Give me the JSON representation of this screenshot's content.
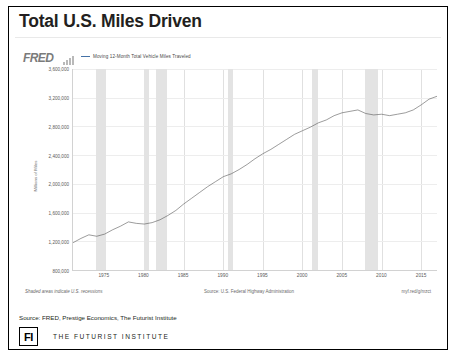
{
  "slide": {
    "title": "Total U.S. Miles Driven",
    "source_line": "Source: FRED, Prestige Economics, The Futurist Institute"
  },
  "footer": {
    "logo_text": "FI",
    "org_name": "THE FUTURIST INSTITUTE"
  },
  "fred": {
    "brand": "FRED",
    "spark_icon": "sparkline-icon",
    "legend": "Moving 12-Month Total Vehicle Miles Traveled",
    "note_left": "Shaded areas indicate U.S. recessions",
    "note_center": "Source: U.S. Federal Highway Administration",
    "note_right": "myf.red/g/mzct"
  },
  "chart_data": {
    "type": "line",
    "title": "Total U.S. Miles Driven",
    "legend_position": "top",
    "grid": true,
    "xlabel": "",
    "ylabel": "Millions of Miles",
    "ylim": [
      800000,
      3600000
    ],
    "yticks": [
      800000,
      1200000,
      1600000,
      2000000,
      2400000,
      2800000,
      3200000,
      3600000
    ],
    "ytick_labels": [
      "800,000",
      "1,200,000",
      "1,600,000",
      "2,000,000",
      "2,400,000",
      "2,800,000",
      "3,200,000",
      "3,600,000"
    ],
    "xlim": [
      1971,
      2017
    ],
    "xticks": [
      1975,
      1980,
      1985,
      1990,
      1995,
      2000,
      2005,
      2010,
      2015
    ],
    "xtick_labels": [
      "1975",
      "1980",
      "1985",
      "1990",
      "1995",
      "2000",
      "2005",
      "2010",
      "2015"
    ],
    "series": [
      {
        "name": "Moving 12-Month Total Vehicle Miles Traveled",
        "color": "#4a4a4a",
        "x": [
          1971,
          1972,
          1973,
          1974,
          1975,
          1976,
          1977,
          1978,
          1979,
          1980,
          1981,
          1982,
          1983,
          1984,
          1985,
          1986,
          1987,
          1988,
          1989,
          1990,
          1991,
          1992,
          1993,
          1994,
          1995,
          1996,
          1997,
          1998,
          1999,
          2000,
          2001,
          2002,
          2003,
          2004,
          2005,
          2006,
          2007,
          2008,
          2009,
          2010,
          2011,
          2012,
          2013,
          2014,
          2015,
          2016,
          2017
        ],
        "values": [
          1180000,
          1240000,
          1290000,
          1270000,
          1300000,
          1360000,
          1410000,
          1470000,
          1450000,
          1440000,
          1460000,
          1500000,
          1560000,
          1630000,
          1720000,
          1800000,
          1880000,
          1960000,
          2030000,
          2100000,
          2140000,
          2200000,
          2270000,
          2350000,
          2420000,
          2480000,
          2550000,
          2620000,
          2690000,
          2740000,
          2790000,
          2850000,
          2890000,
          2950000,
          2990000,
          3010000,
          3030000,
          2980000,
          2960000,
          2970000,
          2950000,
          2970000,
          2990000,
          3030000,
          3100000,
          3180000,
          3220000
        ]
      }
    ],
    "recessions": [
      {
        "start": 1973.9,
        "end": 1975.2
      },
      {
        "start": 1980.0,
        "end": 1980.6
      },
      {
        "start": 1981.5,
        "end": 1982.9
      },
      {
        "start": 1990.6,
        "end": 1991.2
      },
      {
        "start": 2001.2,
        "end": 2001.9
      },
      {
        "start": 2007.9,
        "end": 2009.5
      }
    ]
  }
}
